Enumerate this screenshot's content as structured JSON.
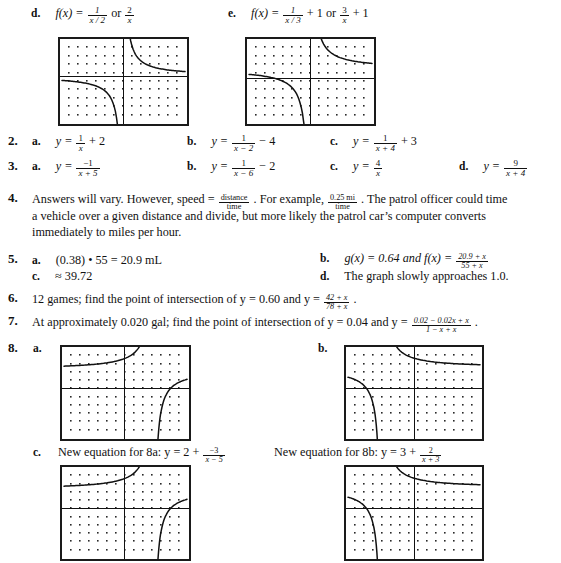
{
  "page": {
    "width": 561,
    "height": 563,
    "background": "#ffffff",
    "ink": "#111111"
  },
  "problem_1": {
    "part_d": {
      "label": "d.",
      "expr_prefix": "f(x) =",
      "frac1": {
        "num": "1",
        "den": "x / 2"
      },
      "conj": "or",
      "frac2": {
        "num": "2",
        "den": "x"
      }
    },
    "part_e": {
      "label": "e.",
      "expr_prefix": "f(x) =",
      "frac1": {
        "num": "1",
        "den": "x / 3"
      },
      "plus1": "+ 1",
      "conj": "or",
      "frac2": {
        "num": "3",
        "den": "x"
      },
      "plus2": "+ 1"
    }
  },
  "problem_2": {
    "number": "2.",
    "items": [
      {
        "label": "a.",
        "lhs": "y =",
        "frac": {
          "num": "1",
          "den": "x"
        },
        "tail": "+ 2"
      },
      {
        "label": "b.",
        "lhs": "y =",
        "frac": {
          "num": "1",
          "den": "x − 2"
        },
        "tail": "− 4"
      },
      {
        "label": "c.",
        "lhs": "y =",
        "frac": {
          "num": "1",
          "den": "x + 4"
        },
        "tail": "+ 3"
      }
    ]
  },
  "problem_3": {
    "number": "3.",
    "items": [
      {
        "label": "a.",
        "lhs": "y =",
        "frac": {
          "num": "−1",
          "den": "x + 5"
        },
        "tail": ""
      },
      {
        "label": "b.",
        "lhs": "y =",
        "frac": {
          "num": "1",
          "den": "x − 6"
        },
        "tail": "− 2"
      },
      {
        "label": "c.",
        "lhs": "y =",
        "frac": {
          "num": "4",
          "den": "x"
        },
        "tail": ""
      },
      {
        "label": "d.",
        "lhs": "y =",
        "frac": {
          "num": "9",
          "den": "x + 4"
        },
        "tail": ""
      }
    ]
  },
  "problem_4": {
    "number": "4.",
    "seg1": "Answers will vary. However, speed =",
    "frac1": {
      "num": "distance",
      "den": "time"
    },
    "seg2": ". For example,",
    "frac2": {
      "num": "0.25 mi",
      "den": "time"
    },
    "seg3": ". The patrol officer could time",
    "line2": "a vehicle over a given distance and divide, but more likely the patrol car’s computer converts",
    "line3": "immediately to miles per hour."
  },
  "problem_5": {
    "number": "5.",
    "a": {
      "label": "a.",
      "text": "(0.38) • 55 = 20.9 mL"
    },
    "c": {
      "label": "c.",
      "text": "≈ 39.72"
    },
    "b": {
      "label": "b.",
      "text": "g(x) = 0.64 and f(x) =",
      "frac": {
        "num": "20.9 + x",
        "den": "55 + x"
      }
    },
    "d": {
      "label": "d.",
      "text": "The graph slowly approaches 1.0."
    }
  },
  "problem_6": {
    "number": "6.",
    "text": "12 games; find the point of intersection of y = 0.60 and y =",
    "frac": {
      "num": "42 + x",
      "den": "78 + x"
    },
    "period": "."
  },
  "problem_7": {
    "number": "7.",
    "text": "At approximately 0.020 gal; find the point of intersection of y = 0.04 and y =",
    "frac": {
      "num": "0.02 − 0.02x + x",
      "den": "1 − x + x"
    },
    "period": "."
  },
  "problem_8": {
    "number": "8.",
    "label_a": "a.",
    "label_b": "b.",
    "label_c": "c.",
    "new_eq_8a": {
      "text": "New equation for 8a: y = 2 +",
      "frac": {
        "num": "−3",
        "den": "x − 5"
      }
    },
    "new_eq_8b": {
      "text": "New equation for 8b: y = 3 +",
      "frac": {
        "num": "2",
        "den": "x + 3"
      }
    }
  },
  "graphs": [
    {
      "id": "graph-1d",
      "name": "graph-problem-1d",
      "x": 58,
      "y": 37,
      "w": 131,
      "h": 89,
      "axis_x_pct": 50.0,
      "axis_y_pct": 44.0,
      "dot_cols": 13,
      "dot_rows": 9,
      "description": "reciprocal hyperbola y = 2/x, asymptotes at x = 0 and y = 0"
    },
    {
      "id": "graph-1e",
      "name": "graph-problem-1e",
      "x": 245,
      "y": 37,
      "w": 131,
      "h": 89,
      "axis_x_pct": 50.0,
      "axis_y_pct": 47.0,
      "dot_cols": 13,
      "dot_rows": 9,
      "description": "y = 3/x + 1, vertical asymptote x = 0, horizontal asymptote y = 1"
    },
    {
      "id": "graph-8a",
      "name": "graph-problem-8a",
      "x": 60,
      "y": 345,
      "w": 131,
      "h": 96,
      "axis_x_pct": 49.0,
      "axis_y_pct": 45.0,
      "dot_cols": 13,
      "dot_rows": 10,
      "description": "rational function with vertical asymptote right of origin and horizontal asymptote above x-axis"
    },
    {
      "id": "graph-8b",
      "name": "graph-problem-8b",
      "x": 344,
      "y": 345,
      "w": 140,
      "h": 96,
      "axis_x_pct": 50.0,
      "axis_y_pct": 45.0,
      "dot_cols": 14,
      "dot_rows": 10,
      "description": "rational function with vertical asymptote left of origin and horizontal asymptote above x-axis"
    },
    {
      "id": "graph-8c-left",
      "name": "graph-problem-8c-left",
      "x": 60,
      "y": 465,
      "w": 131,
      "h": 96,
      "axis_x_pct": 49.0,
      "axis_y_pct": 45.0,
      "dot_cols": 13,
      "dot_rows": 10,
      "description": "new equation 8a graph, same shape as 8a"
    },
    {
      "id": "graph-8c-right",
      "name": "graph-problem-8c-right",
      "x": 344,
      "y": 465,
      "w": 140,
      "h": 96,
      "axis_x_pct": 50.0,
      "axis_y_pct": 45.0,
      "dot_cols": 14,
      "dot_rows": 10,
      "description": "new equation 8b graph, same shape as 8b"
    }
  ]
}
